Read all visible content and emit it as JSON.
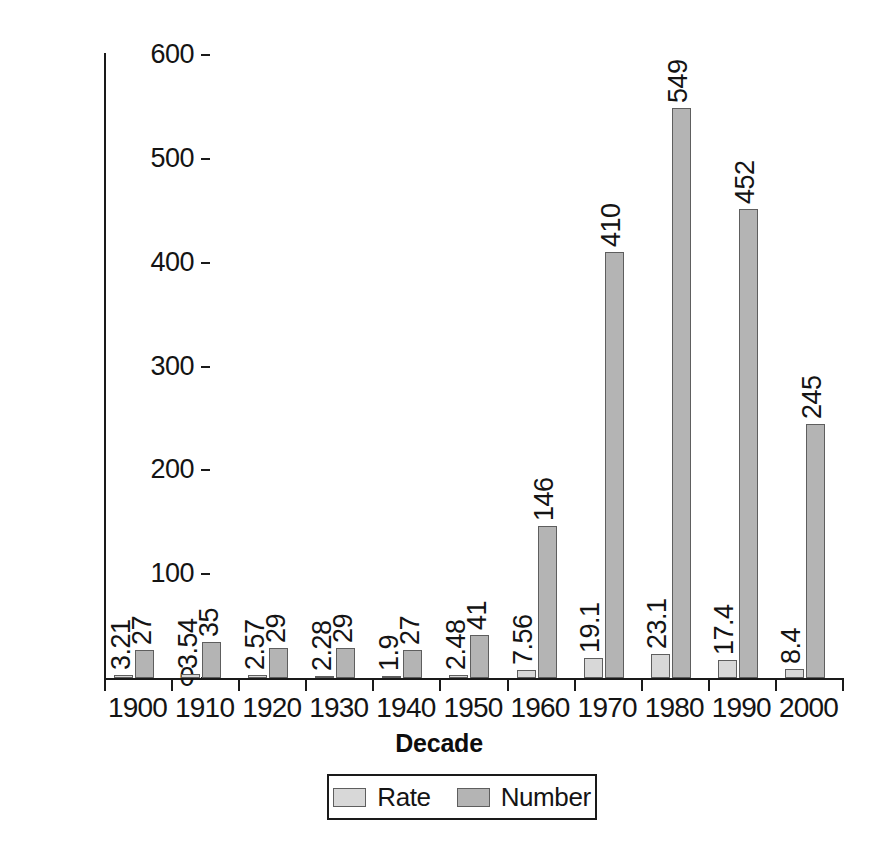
{
  "chart_data": {
    "type": "bar",
    "title": "",
    "xlabel": "Decade",
    "ylabel": "",
    "ylim": [
      0,
      600
    ],
    "yticks": [
      0,
      100,
      200,
      300,
      400,
      500,
      600
    ],
    "ytick_labels": [
      "0",
      "100",
      "200",
      "300",
      "400",
      "500",
      "600"
    ],
    "grid": false,
    "legend_position": "bottom-center",
    "categories": [
      "1900",
      "1910",
      "1920",
      "1930",
      "1940",
      "1950",
      "1960",
      "1970",
      "1980",
      "1990",
      "2000"
    ],
    "series": [
      {
        "name": "Rate",
        "color": "#d8d8d8",
        "values": [
          3.21,
          3.54,
          2.57,
          2.28,
          1.9,
          2.48,
          7.56,
          19.1,
          23.1,
          17.4,
          8.4
        ],
        "labels": [
          "3.21",
          "3.54",
          "2.57",
          "2.28",
          "1.9",
          "2.48",
          "7.56",
          "19.1",
          "23.1",
          "17.4",
          "8.4"
        ]
      },
      {
        "name": "Number",
        "color": "#b4b4b4",
        "values": [
          27,
          35,
          29,
          29,
          27,
          41,
          146,
          410,
          549,
          452,
          245
        ],
        "labels": [
          "27",
          "35",
          "29",
          "29",
          "27",
          "41",
          "146",
          "410",
          "549",
          "452",
          "245"
        ]
      }
    ]
  },
  "legend": {
    "items": [
      {
        "label": "Rate",
        "swatch": "rate"
      },
      {
        "label": "Number",
        "swatch": "number"
      }
    ]
  },
  "axis_title": "Decade"
}
